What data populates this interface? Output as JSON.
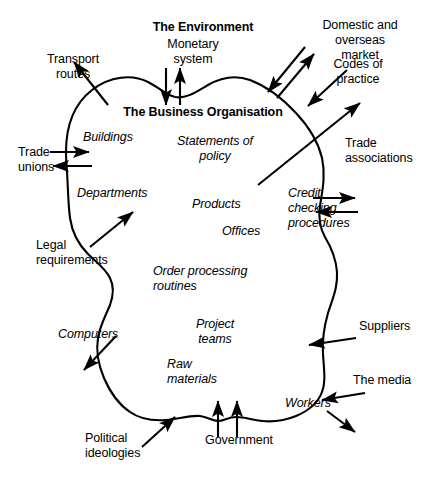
{
  "diagram": {
    "type": "boundary-influence-diagram",
    "stroke_color": "#000000",
    "background_color": "#ffffff",
    "headings": [
      {
        "id": "environment",
        "text": "The Environment",
        "style": "bold"
      },
      {
        "id": "business-organisation",
        "text": "The Business Organisation",
        "style": "bold"
      }
    ],
    "external_factors": [
      {
        "id": "transport-routes",
        "text": "Transport\nroutes",
        "arrow": "outward"
      },
      {
        "id": "monetary-system",
        "text": "Monetary\nsystem",
        "arrow": "bidirectional"
      },
      {
        "id": "domestic-overseas-market",
        "text": "Domestic and\noverseas market",
        "arrow": "bidirectional"
      },
      {
        "id": "codes-of-practice",
        "text": "Codes of\npractice",
        "arrow": "inward"
      },
      {
        "id": "trade-associations",
        "text": "Trade\nassociations",
        "arrow": "outward"
      },
      {
        "id": "credit-checking-procedures",
        "text": "Credit\nchecking\nprocedures",
        "arrow": "bidirectional"
      },
      {
        "id": "trade-unions",
        "text": "Trade\nunions",
        "arrow": "bidirectional"
      },
      {
        "id": "legal-requirements",
        "text": "Legal\nrequirements",
        "arrow": "inward"
      },
      {
        "id": "suppliers",
        "text": "Suppliers",
        "arrow": "inward"
      },
      {
        "id": "the-media",
        "text": "The media",
        "arrow": "inward"
      },
      {
        "id": "political-ideologies",
        "text": "Political\nideologies",
        "arrow": "inward"
      },
      {
        "id": "government",
        "text": "Government",
        "arrow": "inward"
      }
    ],
    "internal_elements": [
      {
        "id": "buildings",
        "text": "Buildings"
      },
      {
        "id": "departments",
        "text": "Departments"
      },
      {
        "id": "statements-of-policy",
        "text": "Statements of\npolicy"
      },
      {
        "id": "products",
        "text": "Products"
      },
      {
        "id": "offices",
        "text": "Offices"
      },
      {
        "id": "order-processing-routines",
        "text": "Order processing\nroutines"
      },
      {
        "id": "computers",
        "text": "Computers"
      },
      {
        "id": "project-teams",
        "text": "Project\nteams"
      },
      {
        "id": "raw-materials",
        "text": "Raw\nmaterials"
      },
      {
        "id": "workers",
        "text": "Workers"
      }
    ]
  }
}
